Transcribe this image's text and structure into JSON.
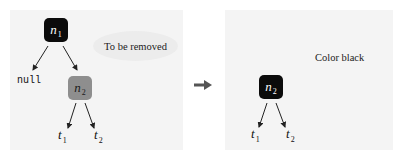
{
  "diagram": {
    "before": {
      "root": {
        "label": "n",
        "sub": "1",
        "color": "#0b0b0b"
      },
      "left_child": {
        "label": "null"
      },
      "right_child": {
        "label": "n",
        "sub": "2",
        "color": "#8e8e8e"
      },
      "leaves": [
        {
          "label": "t",
          "sub": "1"
        },
        {
          "label": "t",
          "sub": "2"
        }
      ],
      "annotation": "To be removed"
    },
    "transition": "arrow-right-icon",
    "after": {
      "root": {
        "label": "n",
        "sub": "2",
        "color": "#0b0b0b"
      },
      "leaves": [
        {
          "label": "t",
          "sub": "1"
        },
        {
          "label": "t",
          "sub": "2"
        }
      ],
      "annotation": "Color black"
    },
    "colors": {
      "panel_background": "#f4f4f4",
      "black_node": "#0b0b0b",
      "gray_node": "#8e8e8e",
      "arrow": "#555555"
    }
  }
}
